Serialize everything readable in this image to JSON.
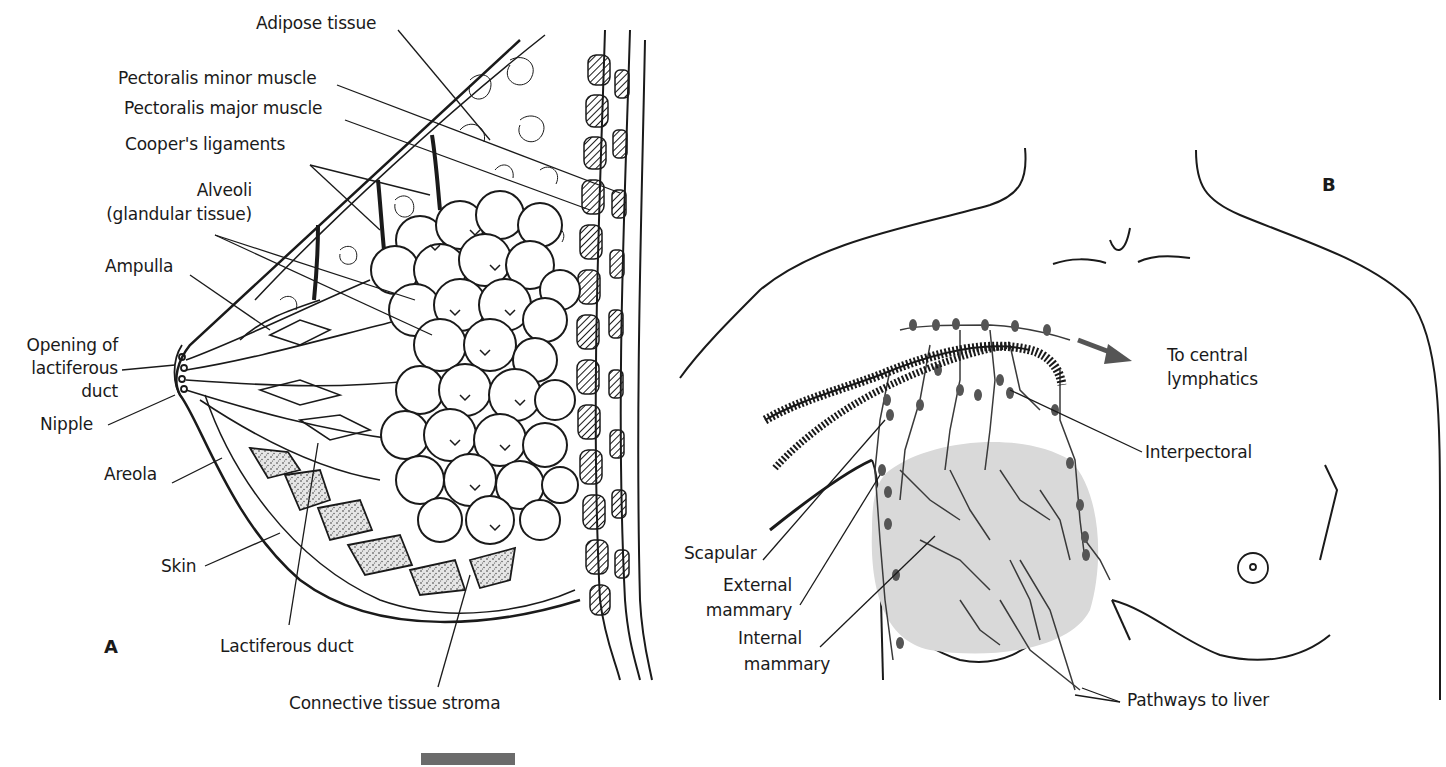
{
  "figure": {
    "panels": [
      {
        "id": "A",
        "letter": "A",
        "description": "Sagittal section of the breast",
        "labels": {
          "adipose_tissue": "Adipose tissue",
          "pectoralis_minor": "Pectoralis minor muscle",
          "pectoralis_major": "Pectoralis major muscle",
          "coopers_ligaments": "Cooper's ligaments",
          "alveoli_1": "Alveoli",
          "alveoli_2": "(glandular tissue)",
          "ampulla": "Ampulla",
          "opening_1": "Opening of",
          "opening_2": "lactiferous",
          "opening_3": "duct",
          "nipple": "Nipple",
          "areola": "Areola",
          "skin": "Skin",
          "lactiferous_duct": "Lactiferous duct",
          "connective_tissue": "Connective tissue stroma"
        }
      },
      {
        "id": "B",
        "letter": "B",
        "description": "Lymphatic drainage of the breast",
        "labels": {
          "to_central_1": "To central",
          "to_central_2": "lymphatics",
          "interpectoral": "Interpectoral",
          "scapular": "Scapular",
          "external_1": "External",
          "external_2": "mammary",
          "internal_1": "Internal",
          "internal_2": "mammary",
          "pathways": "Pathways to liver"
        }
      }
    ],
    "colors": {
      "ink": "#1a1a1a",
      "gland_shade": "#d9d9d9",
      "lymph_node": "#555555",
      "arrow": "#555555",
      "scalebar": "#6b6b6b"
    }
  }
}
